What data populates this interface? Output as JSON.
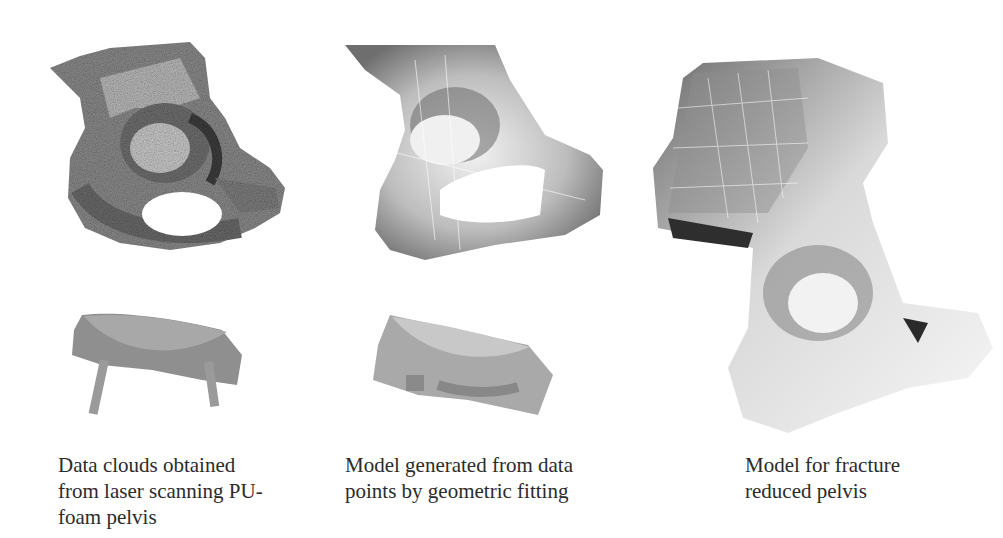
{
  "figure": {
    "panels": [
      {
        "id": "laser-scan",
        "image_description": "Noisy point-cloud rendering of a pelvis (acetabulum view) and a small scanned fragment with two support rods",
        "caption_lines": [
          "Data clouds obtained",
          "from laser scanning PU-",
          "foam pelvis"
        ]
      },
      {
        "id": "geometric-fit",
        "image_description": "Smooth surface model of pelvis with faint mesh lines, and a smooth fitted fragment surface",
        "caption_lines": [
          "Model generated from data",
          "points by geometric fitting"
        ]
      },
      {
        "id": "fracture-reduced",
        "image_description": "Full smooth surface model of hemipelvis including iliac wing, acetabulum and obturator region",
        "caption_lines": [
          "Model for fracture",
          "reduced pelvis"
        ]
      }
    ]
  }
}
